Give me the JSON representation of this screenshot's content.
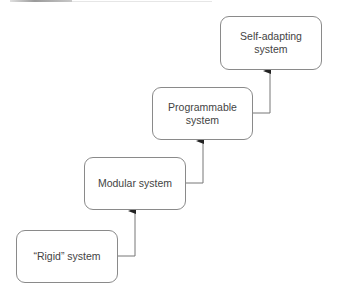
{
  "diagram": {
    "type": "staircase-flow",
    "nodes": [
      {
        "id": "rigid",
        "label": "“Rigid” system"
      },
      {
        "id": "modular",
        "label": "Modular system"
      },
      {
        "id": "programmable",
        "label_line1": "Programmable",
        "label_line2": "system"
      },
      {
        "id": "self_adapting",
        "label_line1": "Self-adapting",
        "label_line2": "system"
      }
    ],
    "edges": [
      {
        "from": "rigid",
        "to": "modular"
      },
      {
        "from": "modular",
        "to": "programmable"
      },
      {
        "from": "programmable",
        "to": "self_adapting"
      }
    ],
    "colors": {
      "border": "#8a8a8a",
      "text": "#444444",
      "connector": "#666666"
    }
  }
}
